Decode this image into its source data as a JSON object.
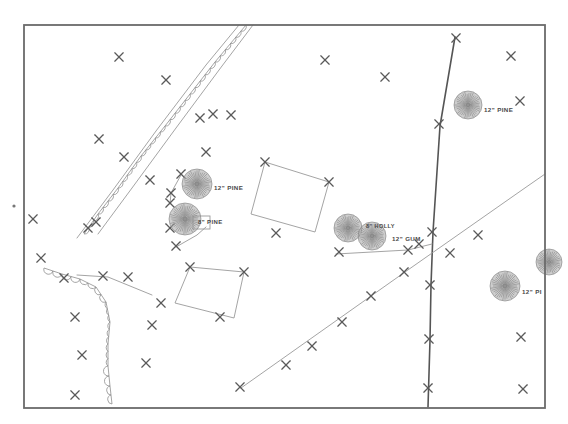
{
  "document": {
    "type": "survey-site-plan",
    "title": "Tree Survey Site Plan",
    "description": "Scanned black-and-white surveyor site plan showing property border, brush/tree line, survey control crosses, two rotated building footprints, road centerline and diagonal utility line, with labelled individual trees."
  },
  "colors": {
    "border": "#6b6b6b",
    "line_light": "#9a9a9a",
    "line_dark": "#555555",
    "brush": "#8e8e8e",
    "cross": "#5a5a5a",
    "tree_fill": "#a6a6a6",
    "tree_stroke": "#7d7d7d",
    "label_text": "#4a4a4a",
    "page": "#ffffff"
  },
  "frame": {
    "label": "map-border",
    "x": 24,
    "y": 25,
    "width": 521,
    "height": 383
  },
  "stray_dot": {
    "label": "stray-ink-dot",
    "x": 14,
    "y": 206,
    "r": 1.6
  },
  "tree_labels": [
    {
      "id": "tree-12-pine-upper",
      "text": "12\" PINE",
      "x": 214,
      "y": 188,
      "size": 6.2
    },
    {
      "id": "tree-8-pine",
      "text": "8\" PINE",
      "x": 198,
      "y": 222,
      "size": 6.0
    },
    {
      "id": "tree-8-holly",
      "text": "8\" HOLLY",
      "x": 366,
      "y": 227,
      "size": 5.6
    },
    {
      "id": "tree-12-gum",
      "text": "12\" GUM",
      "x": 392,
      "y": 239,
      "size": 6.2
    },
    {
      "id": "tree-12-pine-right",
      "text": "12\" PINE",
      "x": 484,
      "y": 110,
      "size": 6.2
    },
    {
      "id": "tree-12-pine-clip",
      "text": "12\" PI",
      "x": 522,
      "y": 292,
      "size": 6.2
    }
  ],
  "trees": [
    {
      "id": "tree-symbol-12-pine-upper",
      "cx": 197,
      "cy": 184,
      "r": 15,
      "spokes": 40
    },
    {
      "id": "tree-symbol-8-pine",
      "cx": 185,
      "cy": 219,
      "r": 16,
      "spokes": 42
    },
    {
      "id": "tree-symbol-8-holly",
      "cx": 348,
      "cy": 228,
      "r": 14,
      "spokes": 38
    },
    {
      "id": "tree-symbol-12-gum",
      "cx": 372,
      "cy": 236,
      "r": 14,
      "spokes": 38
    },
    {
      "id": "tree-symbol-12-pine-right",
      "cx": 468,
      "cy": 105,
      "r": 14,
      "spokes": 38
    },
    {
      "id": "tree-symbol-12-pine-lower",
      "cx": 505,
      "cy": 286,
      "r": 15,
      "spokes": 40
    },
    {
      "id": "tree-symbol-edge-clipped",
      "cx": 549,
      "cy": 262,
      "r": 13,
      "spokes": 36
    }
  ],
  "crosses": [
    {
      "x": 119,
      "y": 57
    },
    {
      "x": 166,
      "y": 80
    },
    {
      "x": 99,
      "y": 139
    },
    {
      "x": 124,
      "y": 157
    },
    {
      "x": 325,
      "y": 60
    },
    {
      "x": 385,
      "y": 77
    },
    {
      "x": 200,
      "y": 118
    },
    {
      "x": 213,
      "y": 114
    },
    {
      "x": 231,
      "y": 115
    },
    {
      "x": 206,
      "y": 152
    },
    {
      "x": 181,
      "y": 174
    },
    {
      "x": 171,
      "y": 193
    },
    {
      "x": 170,
      "y": 203
    },
    {
      "x": 150,
      "y": 180
    },
    {
      "x": 170,
      "y": 228
    },
    {
      "x": 176,
      "y": 246
    },
    {
      "x": 96,
      "y": 222
    },
    {
      "x": 88,
      "y": 228
    },
    {
      "x": 64,
      "y": 278
    },
    {
      "x": 103,
      "y": 276
    },
    {
      "x": 128,
      "y": 277
    },
    {
      "x": 75,
      "y": 317
    },
    {
      "x": 82,
      "y": 355
    },
    {
      "x": 75,
      "y": 395
    },
    {
      "x": 146,
      "y": 363
    },
    {
      "x": 152,
      "y": 325
    },
    {
      "x": 265,
      "y": 162
    },
    {
      "x": 329,
      "y": 182
    },
    {
      "x": 276,
      "y": 233
    },
    {
      "x": 339,
      "y": 252
    },
    {
      "x": 190,
      "y": 267
    },
    {
      "x": 244,
      "y": 272
    },
    {
      "x": 161,
      "y": 303
    },
    {
      "x": 220,
      "y": 317
    },
    {
      "x": 456,
      "y": 38
    },
    {
      "x": 439,
      "y": 124
    },
    {
      "x": 432,
      "y": 232
    },
    {
      "x": 430,
      "y": 285
    },
    {
      "x": 429,
      "y": 339
    },
    {
      "x": 428,
      "y": 388
    },
    {
      "x": 419,
      "y": 244
    },
    {
      "x": 408,
      "y": 250
    },
    {
      "x": 240,
      "y": 387
    },
    {
      "x": 286,
      "y": 365
    },
    {
      "x": 312,
      "y": 346
    },
    {
      "x": 342,
      "y": 322
    },
    {
      "x": 371,
      "y": 296
    },
    {
      "x": 404,
      "y": 272
    },
    {
      "x": 450,
      "y": 253
    },
    {
      "x": 478,
      "y": 235
    },
    {
      "x": 511,
      "y": 56
    },
    {
      "x": 520,
      "y": 101
    },
    {
      "x": 523,
      "y": 389
    },
    {
      "x": 521,
      "y": 337
    },
    {
      "x": 33,
      "y": 219
    },
    {
      "x": 41,
      "y": 258
    }
  ],
  "lines": [
    {
      "id": "road-centerline",
      "style": "dark",
      "points": "455,37 440,126 433,232 431,285 430,340 428,407"
    },
    {
      "id": "utility-diagonal",
      "style": "light",
      "points": "241,388 405,272 522,190 545,174"
    },
    {
      "id": "lot-line-north-a",
      "style": "light",
      "points": "239,25 206,65 156,131 113,190 77,238"
    },
    {
      "id": "lot-line-north-b",
      "style": "light",
      "points": "253,25 222,66 176,128 132,188 98,234"
    },
    {
      "id": "lot-line-to-building",
      "style": "light",
      "points": "77,275 108,277 152,295"
    },
    {
      "id": "tie-line-se",
      "style": "light",
      "points": "336,254 408,250 432,244"
    },
    {
      "id": "tie-line-tree",
      "style": "light",
      "points": "176,247 197,235 206,227"
    },
    {
      "id": "tie-line-nw",
      "style": "light",
      "points": "170,204 171,193 181,175"
    }
  ],
  "building_footprints": [
    {
      "id": "building-footprint-east",
      "points": "265,162 329,182 315,232 251,214",
      "corners": [
        [
          265,
          162
        ],
        [
          329,
          182
        ],
        [
          315,
          232
        ],
        [
          251,
          214
        ]
      ]
    },
    {
      "id": "building-footprint-west",
      "points": "190,267 244,272 234,318 175,303",
      "corners": [
        [
          190,
          267
        ],
        [
          244,
          272
        ],
        [
          234,
          318
        ],
        [
          175,
          303
        ]
      ]
    }
  ],
  "brush_lines": [
    {
      "id": "brush-line-diagonal",
      "points": "246,25 215,62 190,94 165,126 141,156 118,188 98,214 84,234",
      "scallop_r": 4.6,
      "side": 1
    },
    {
      "id": "brush-line-west",
      "points": "44,268 62,274 80,279 96,287 106,302 110,322 108,344 108,366 110,386 112,404",
      "scallop_r": 4.6,
      "side": -1
    }
  ],
  "small_rect": {
    "id": "tree-callout-box",
    "x": 193,
    "y": 216,
    "w": 17,
    "h": 13
  }
}
